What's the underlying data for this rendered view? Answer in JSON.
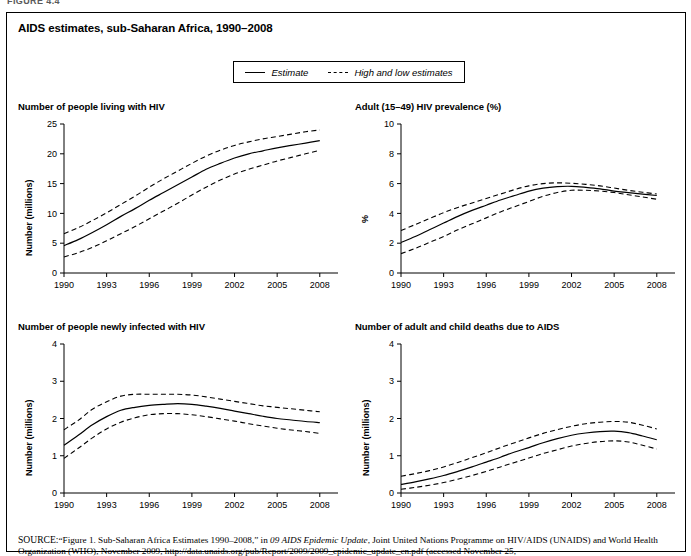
{
  "page": {
    "top_cut_label": "FIGURE 4.4",
    "figure_title": "AIDS estimates, sub-Saharan Africa, 1990–2008"
  },
  "legend": {
    "items": [
      {
        "label": "Estimate",
        "style": "solid",
        "icon": "solid-line-swatch"
      },
      {
        "label": "High and low estimates",
        "style": "dashed",
        "icon": "dashed-line-swatch"
      }
    ]
  },
  "source": {
    "prefix": "SOURCE:",
    "line1_a": "“Figure 1. Sub-Saharan Africa Estimates 1990–2008,” in ",
    "line1_italic": "09 AIDS Epidemic Update",
    "line1_b": ", Joint United Nations Programme on HIV/AIDS (UNAIDS)",
    "line2": "and World Health Organization (WHO), November 2009, http://data.unaids.org/pub/Report/2009/2009_epidemic_update_en.pdf (accessed November 25,"
  },
  "chart_data": [
    {
      "id": "people-living-with-hiv",
      "type": "line",
      "title": "Number of people living with HIV",
      "xlabel": "",
      "ylabel": "Number (millions)",
      "xlim": [
        1990,
        2009
      ],
      "ylim": [
        0,
        25
      ],
      "yticks": [
        0,
        5,
        10,
        15,
        20,
        25
      ],
      "xticks": [
        1990,
        1993,
        1996,
        1999,
        2002,
        2005,
        2008
      ],
      "grid": false,
      "legend_position": "figure-top",
      "x": [
        1990,
        1991,
        1992,
        1993,
        1994,
        1995,
        1996,
        1997,
        1998,
        1999,
        2000,
        2001,
        2002,
        2003,
        2004,
        2005,
        2006,
        2007,
        2008
      ],
      "series": [
        {
          "name": "Estimate",
          "style": "solid",
          "values": [
            4.6,
            5.6,
            6.8,
            8.1,
            9.5,
            10.8,
            12.2,
            13.5,
            14.8,
            16.1,
            17.4,
            18.4,
            19.3,
            20.0,
            20.5,
            21.0,
            21.4,
            21.8,
            22.2
          ]
        },
        {
          "name": "High estimate",
          "style": "dashed",
          "values": [
            6.6,
            7.6,
            8.8,
            10.1,
            11.5,
            12.9,
            14.4,
            15.8,
            17.1,
            18.4,
            19.6,
            20.6,
            21.4,
            22.0,
            22.5,
            22.9,
            23.3,
            23.7,
            24.0
          ]
        },
        {
          "name": "Low estimate",
          "style": "dashed",
          "values": [
            2.7,
            3.4,
            4.3,
            5.4,
            6.6,
            7.8,
            9.1,
            10.4,
            11.7,
            13.1,
            14.4,
            15.6,
            16.6,
            17.4,
            18.1,
            18.8,
            19.4,
            20.0,
            20.6
          ]
        }
      ]
    },
    {
      "id": "adult-hiv-prevalence",
      "type": "line",
      "title": "Adult (15–49) HIV prevalence (%)",
      "xlabel": "",
      "ylabel": "%",
      "xlim": [
        1990,
        2009
      ],
      "ylim": [
        0,
        10
      ],
      "yticks": [
        0,
        2,
        4,
        6,
        8,
        10
      ],
      "xticks": [
        1990,
        1993,
        1996,
        1999,
        2002,
        2005,
        2008
      ],
      "grid": false,
      "legend_position": "figure-top",
      "x": [
        1990,
        1991,
        1992,
        1993,
        1994,
        1995,
        1996,
        1997,
        1998,
        1999,
        2000,
        2001,
        2002,
        2003,
        2004,
        2005,
        2006,
        2007,
        2008
      ],
      "series": [
        {
          "name": "Estimate",
          "style": "solid",
          "values": [
            2.05,
            2.45,
            2.9,
            3.35,
            3.8,
            4.2,
            4.55,
            4.9,
            5.2,
            5.5,
            5.7,
            5.8,
            5.82,
            5.75,
            5.65,
            5.5,
            5.4,
            5.3,
            5.2
          ]
        },
        {
          "name": "High estimate",
          "style": "dashed",
          "values": [
            2.85,
            3.25,
            3.65,
            4.05,
            4.4,
            4.7,
            5.0,
            5.3,
            5.6,
            5.85,
            6.0,
            6.05,
            6.02,
            5.95,
            5.85,
            5.7,
            5.55,
            5.42,
            5.3
          ]
        },
        {
          "name": "Low estimate",
          "style": "dashed",
          "values": [
            1.3,
            1.65,
            2.05,
            2.45,
            2.9,
            3.3,
            3.7,
            4.1,
            4.45,
            4.8,
            5.15,
            5.4,
            5.55,
            5.55,
            5.5,
            5.4,
            5.25,
            5.1,
            4.95
          ]
        }
      ]
    },
    {
      "id": "newly-infected-with-hiv",
      "type": "line",
      "title": "Number of people newly infected with HIV",
      "xlabel": "",
      "ylabel": "Number (millions)",
      "xlim": [
        1990,
        2009
      ],
      "ylim": [
        0,
        4
      ],
      "yticks": [
        0,
        1,
        2,
        3,
        4
      ],
      "xticks": [
        1990,
        1993,
        1996,
        1999,
        2002,
        2005,
        2008
      ],
      "grid": false,
      "legend_position": "figure-top",
      "x": [
        1990,
        1991,
        1992,
        1993,
        1994,
        1995,
        1996,
        1997,
        1998,
        1999,
        2000,
        2001,
        2002,
        2003,
        2004,
        2005,
        2006,
        2007,
        2008
      ],
      "series": [
        {
          "name": "Estimate",
          "style": "solid",
          "values": [
            1.28,
            1.55,
            1.83,
            2.05,
            2.22,
            2.3,
            2.35,
            2.38,
            2.4,
            2.38,
            2.33,
            2.27,
            2.2,
            2.13,
            2.06,
            2.0,
            1.96,
            1.92,
            1.89
          ]
        },
        {
          "name": "High estimate",
          "style": "dashed",
          "values": [
            1.7,
            1.95,
            2.25,
            2.45,
            2.6,
            2.65,
            2.65,
            2.65,
            2.65,
            2.63,
            2.58,
            2.52,
            2.46,
            2.4,
            2.34,
            2.3,
            2.26,
            2.22,
            2.18
          ]
        },
        {
          "name": "Low estimate",
          "style": "dashed",
          "values": [
            0.93,
            1.2,
            1.48,
            1.72,
            1.9,
            2.02,
            2.1,
            2.13,
            2.13,
            2.1,
            2.05,
            1.99,
            1.93,
            1.86,
            1.8,
            1.74,
            1.69,
            1.65,
            1.6
          ]
        }
      ]
    },
    {
      "id": "adult-and-child-deaths",
      "type": "line",
      "title": "Number of adult and child deaths due to AIDS",
      "xlabel": "",
      "ylabel": "Number (millions)",
      "xlim": [
        1990,
        2009
      ],
      "ylim": [
        0,
        4
      ],
      "yticks": [
        0,
        1,
        2,
        3,
        4
      ],
      "xticks": [
        1990,
        1993,
        1996,
        1999,
        2002,
        2005,
        2008
      ],
      "grid": false,
      "legend_position": "figure-top",
      "x": [
        1990,
        1991,
        1992,
        1993,
        1994,
        1995,
        1996,
        1997,
        1998,
        1999,
        2000,
        2001,
        2002,
        2003,
        2004,
        2005,
        2006,
        2007,
        2008
      ],
      "series": [
        {
          "name": "Estimate",
          "style": "solid",
          "values": [
            0.23,
            0.3,
            0.38,
            0.47,
            0.58,
            0.7,
            0.83,
            0.96,
            1.1,
            1.22,
            1.35,
            1.46,
            1.55,
            1.61,
            1.65,
            1.66,
            1.62,
            1.53,
            1.43
          ]
        },
        {
          "name": "High estimate",
          "style": "dashed",
          "values": [
            0.45,
            0.52,
            0.6,
            0.7,
            0.82,
            0.95,
            1.08,
            1.22,
            1.35,
            1.48,
            1.6,
            1.7,
            1.79,
            1.86,
            1.9,
            1.92,
            1.9,
            1.82,
            1.72
          ]
        },
        {
          "name": "Low estimate",
          "style": "dashed",
          "values": [
            0.1,
            0.15,
            0.21,
            0.28,
            0.37,
            0.47,
            0.58,
            0.7,
            0.82,
            0.94,
            1.06,
            1.16,
            1.26,
            1.33,
            1.38,
            1.4,
            1.37,
            1.28,
            1.18
          ]
        }
      ]
    }
  ]
}
